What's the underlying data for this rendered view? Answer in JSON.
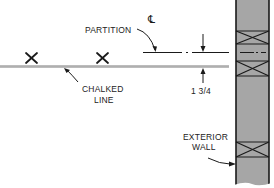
{
  "diagram": {
    "type": "construction-layout-detail",
    "labels": {
      "partition": "PARTITION",
      "centerline": "℄",
      "chalked_line_1": "CHALKED",
      "chalked_line_2": "LINE",
      "dimension": "1 3/4",
      "exterior_wall_1": "EXTERIOR",
      "exterior_wall_2": "WALL"
    },
    "markers": [
      {
        "name": "x-mark-1",
        "x": 32,
        "y": 58
      },
      {
        "name": "x-mark-2",
        "x": 103,
        "y": 58
      }
    ],
    "colors": {
      "line": "#1a1a1a",
      "chalk_line": "#8a8a8a",
      "wall_fill": "#a6a6a6",
      "background": "#ffffff"
    }
  }
}
